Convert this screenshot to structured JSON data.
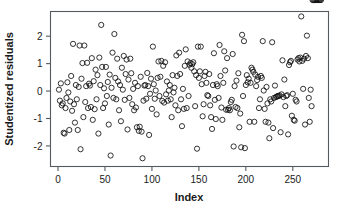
{
  "figure": {
    "background_color": "#ffffff",
    "point_color": "#111111",
    "axis_color": "#555a5e"
  },
  "chart_data": {
    "type": "scatter",
    "title": "",
    "subtitle": "",
    "xlabel": "Index",
    "ylabel": "Studentized residuals",
    "xlim": [
      -8,
      288
    ],
    "ylim": [
      -2.75,
      2.9
    ],
    "xticks": [
      0,
      50,
      100,
      150,
      200,
      250
    ],
    "xticklabels": [
      "0",
      "50",
      "100",
      "150",
      "200",
      "250"
    ],
    "yticks": [
      -2,
      -1,
      0,
      1,
      2
    ],
    "yticklabels": [
      "-2",
      "-1",
      "0",
      "1",
      "2"
    ],
    "grid": false,
    "legend": null,
    "marker": "open-circle",
    "marker_size": 2.6,
    "n_points": 280,
    "x": [
      1,
      2,
      3,
      4,
      5,
      6,
      7,
      8,
      9,
      10,
      11,
      12,
      13,
      14,
      15,
      16,
      17,
      18,
      19,
      20,
      21,
      22,
      23,
      24,
      25,
      26,
      27,
      28,
      29,
      30,
      31,
      32,
      33,
      34,
      35,
      36,
      37,
      38,
      39,
      40,
      41,
      42,
      43,
      44,
      45,
      46,
      47,
      48,
      49,
      50,
      51,
      52,
      53,
      54,
      55,
      56,
      57,
      58,
      59,
      60,
      61,
      62,
      63,
      64,
      65,
      66,
      67,
      68,
      69,
      70,
      71,
      72,
      73,
      74,
      75,
      76,
      77,
      78,
      79,
      80,
      81,
      82,
      83,
      84,
      85,
      86,
      87,
      88,
      89,
      90,
      91,
      92,
      93,
      94,
      95,
      96,
      97,
      98,
      99,
      100,
      101,
      102,
      103,
      104,
      105,
      106,
      107,
      108,
      109,
      110,
      111,
      112,
      113,
      114,
      115,
      116,
      117,
      118,
      119,
      120,
      121,
      122,
      123,
      124,
      125,
      126,
      127,
      128,
      129,
      130,
      131,
      132,
      133,
      134,
      135,
      136,
      137,
      138,
      139,
      140,
      141,
      142,
      143,
      144,
      145,
      146,
      147,
      148,
      149,
      150,
      151,
      152,
      153,
      154,
      155,
      156,
      157,
      158,
      159,
      160,
      161,
      162,
      163,
      164,
      165,
      166,
      167,
      168,
      169,
      170,
      171,
      172,
      173,
      174,
      175,
      176,
      177,
      178,
      179,
      180,
      181,
      182,
      183,
      184,
      185,
      186,
      187,
      188,
      189,
      190,
      191,
      192,
      193,
      194,
      195,
      196,
      197,
      198,
      199,
      200,
      201,
      202,
      203,
      204,
      205,
      206,
      207,
      208,
      209,
      210,
      211,
      212,
      213,
      214,
      215,
      216,
      217,
      218,
      219,
      220,
      221,
      222,
      223,
      224,
      225,
      226,
      227,
      228,
      229,
      230,
      231,
      232,
      233,
      234,
      235,
      236,
      237,
      238,
      239,
      240,
      241,
      242,
      243,
      244,
      245,
      246,
      247,
      248,
      249,
      250,
      251,
      252,
      253,
      254,
      255,
      256,
      257,
      258,
      259,
      260,
      261,
      262,
      263,
      264,
      265,
      266,
      267,
      268,
      269,
      270,
      271,
      272,
      273,
      274,
      275,
      276,
      277,
      278,
      279,
      280
    ],
    "y": [
      0.05,
      -0.35,
      0.28,
      -0.52,
      -0.45,
      -1.52,
      -1.55,
      -0.62,
      -0.25,
      0.32,
      -0.05,
      -1.42,
      -0.38,
      0.55,
      -0.72,
      1.72,
      -0.48,
      -1.15,
      0.22,
      -0.3,
      -1.42,
      0.15,
      1.66,
      -2.12,
      0.45,
      1.02,
      -0.95,
      1.66,
      -0.4,
      0.18,
      1.03,
      -0.62,
      0.27,
      0.2,
      -0.58,
      1.2,
      -1.05,
      0.36,
      -0.66,
      0.78,
      -0.3,
      0.58,
      -1.55,
      1.22,
      0.22,
      2.41,
      0.88,
      -0.62,
      0.1,
      -0.45,
      0.88,
      -0.18,
      0.33,
      -1.22,
      0.6,
      -2.35,
      0.12,
      1.4,
      -0.25,
      2.08,
      0.48,
      -0.3,
      1.18,
      0.35,
      -0.7,
      0.22,
      -1.1,
      0.85,
      0.05,
      1.28,
      -0.32,
      0.62,
      1.15,
      -1.4,
      0.42,
      -0.25,
      1.18,
      0.65,
      -0.48,
      0.08,
      -0.7,
      0.3,
      -0.6,
      -1.32,
      0.18,
      -1.45,
      -1.3,
      0.52,
      -1.48,
      -2.45,
      -0.35,
      0.2,
      0.22,
      -0.28,
      0.66,
      0.18,
      -1.6,
      -0.1,
      0.45,
      -0.65,
      1.62,
      0.25,
      -0.28,
      0.02,
      -0.85,
      0.48,
      1.08,
      -0.18,
      0.52,
      1.1,
      -0.36,
      0.92,
      -0.42,
      1.05,
      -0.12,
      0.35,
      -0.35,
      0.02,
      0.22,
      -0.3,
      -0.95,
      0.58,
      -0.05,
      0.12,
      -0.52,
      1.3,
      0.55,
      -0.7,
      1.4,
      0.62,
      -0.3,
      -1.28,
      0.08,
      -0.65,
      0.92,
      1.52,
      -0.62,
      1.08,
      -0.18,
      0.96,
      1.02,
      0.85,
      0.98,
      1.05,
      0.72,
      -0.55,
      0.58,
      -2.1,
      1.62,
      0.48,
      0.72,
      1.62,
      0.25,
      -0.92,
      -0.48,
      0.55,
      0.7,
      0.3,
      -0.15,
      -0.18,
      0.62,
      -0.52,
      -0.95,
      -1.38,
      0.22,
      1.38,
      -0.32,
      -1.02,
      0.25,
      0.18,
      -0.25,
      1.68,
      0.55,
      -0.6,
      -1.05,
      0.3,
      1.45,
      0.75,
      -0.68,
      1.2,
      -0.68,
      -0.62,
      -0.7,
      -0.4,
      -0.32,
      1.35,
      -2.02,
      0.18,
      -0.58,
      0.38,
      -0.62,
      0.65,
      -1.32,
      -0.82,
      -2.05,
      2.05,
      -0.18,
      1.82,
      -2.08,
      0.22,
      0.58,
      0.32,
      0.45,
      -1.12,
      0.3,
      0.85,
      0.78,
      0.7,
      -1.12,
      0.6,
      0.18,
      0.4,
      0.52,
      -0.62,
      -0.3,
      0.55,
      0.48,
      1.82,
      0.02,
      -0.65,
      -1.12,
      0.15,
      -0.45,
      -1.15,
      -1.72,
      -0.3,
      -0.38,
      1.78,
      -1.35,
      -0.25,
      0.2,
      -0.22,
      -0.2,
      -0.18,
      -0.18,
      -0.16,
      -1.5,
      -0.12,
      1.12,
      -0.22,
      0.42,
      -0.55,
      -0.18,
      -0.15,
      -1.58,
      0.95,
      1.05,
      1.1,
      -0.9,
      -0.1,
      -1.05,
      -1.08,
      -0.32,
      -0.38,
      1.15,
      1.2,
      1.08,
      1.22,
      2.72,
      1.1,
      0.08,
      1.18,
      -1.22,
      1.28,
      2.02,
      1.2,
      -0.25,
      -1.12,
      0.05,
      -0.55
    ]
  }
}
